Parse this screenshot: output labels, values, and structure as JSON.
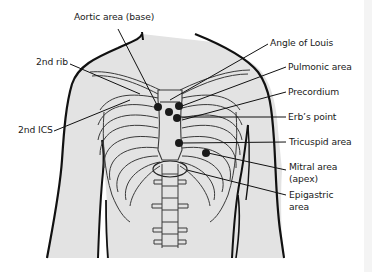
{
  "figure": {
    "type": "anatomical-diagram",
    "colors": {
      "skin_fill": "#e3e3e3",
      "outline": "#111111",
      "bone_line": "#3a3a3a",
      "marker": "#1a1a1a",
      "background": "#ffffff"
    }
  },
  "labels": {
    "aortic": "Aortic area (base)",
    "second_rib": "2nd rib",
    "second_ics": "2nd ICS",
    "angle_of_louis": "Angle of Louis",
    "pulmonic": "Pulmonic area",
    "precordium": "Precordium",
    "erbs_point": "Erb’s point",
    "tricuspid": "Tricuspid area",
    "mitral_line1": "Mitral area",
    "mitral_line2": "(apex)",
    "epigastric_line1": "Epigastric",
    "epigastric_line2": "area"
  },
  "markers": [
    {
      "name": "aortic-area-marker",
      "x": 158,
      "y": 107
    },
    {
      "name": "pulmonic-area-marker",
      "x": 179,
      "y": 106
    },
    {
      "name": "center-marker",
      "x": 169,
      "y": 112
    },
    {
      "name": "erbs-point-marker",
      "x": 177,
      "y": 118
    },
    {
      "name": "tricuspid-area-marker",
      "x": 179,
      "y": 143
    },
    {
      "name": "mitral-area-marker",
      "x": 206,
      "y": 153
    }
  ]
}
